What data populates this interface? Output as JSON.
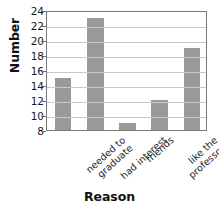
{
  "chart_data": {
    "type": "bar",
    "title": "",
    "xlabel": "Reason",
    "ylabel": "Number",
    "categories": [
      "needed to graduate",
      "had interest",
      "friends",
      "like the professor",
      "fit into schedule"
    ],
    "category_lines": [
      [
        "needed to",
        "graduate"
      ],
      [
        "had interest"
      ],
      [
        "friends"
      ],
      [
        "like the",
        "professor"
      ],
      [
        "fit into",
        "schedule"
      ]
    ],
    "values": [
      15,
      23,
      9,
      12,
      19
    ],
    "ylim": [
      8,
      24
    ],
    "ytick_step": 2,
    "yticks": [
      8,
      10,
      12,
      14,
      16,
      18,
      20,
      22,
      24
    ],
    "grid": true,
    "grid_axis": "y",
    "legend": null,
    "bar_color": "#9a9a9a",
    "grid_color": "#c9c9c9",
    "axis_color": "#7a7a7a",
    "text_color": "#1a1a1a"
  }
}
